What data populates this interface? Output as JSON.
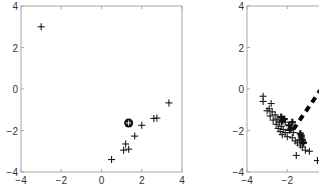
{
  "chart_data": [
    {
      "type": "scatter",
      "title": "",
      "xlabel": "",
      "ylabel": "",
      "xlim": [
        -4,
        4
      ],
      "ylim": [
        -4,
        4
      ],
      "xticks": [
        -4,
        -2,
        0,
        2,
        4
      ],
      "yticks": [
        -4,
        -2,
        0,
        2,
        4
      ],
      "xtick_labels": [
        "−4",
        "−2",
        "0",
        "2",
        "4"
      ],
      "ytick_labels": [
        "−4",
        "−2",
        "0",
        "2",
        "4"
      ],
      "grid": false,
      "frame": {
        "left": 21,
        "top": 6,
        "right": 182,
        "bottom": 172
      },
      "series": [
        {
          "name": "points",
          "marker": "plus",
          "points": [
            [
              -3.0,
              3.0
            ],
            [
              3.35,
              -0.67
            ],
            [
              2.6,
              -1.42
            ],
            [
              2.75,
              -1.4
            ],
            [
              2.0,
              -1.75
            ],
            [
              1.65,
              -2.27
            ],
            [
              1.2,
              -2.65
            ],
            [
              1.1,
              -2.95
            ],
            [
              1.35,
              -2.9
            ],
            [
              0.5,
              -3.4
            ]
          ]
        },
        {
          "name": "center",
          "marker": "circle-plus",
          "points": [
            [
              1.35,
              -1.64
            ]
          ]
        }
      ]
    },
    {
      "type": "scatter",
      "title": "",
      "xlabel": "",
      "ylabel": "",
      "xlim": [
        -4,
        4
      ],
      "ylim": [
        -4,
        4
      ],
      "xticks": [
        -4,
        -2
      ],
      "yticks": [
        -4,
        -2,
        0,
        2,
        4
      ],
      "xtick_labels": [
        "−4",
        "−2"
      ],
      "ytick_labels": [
        "−4",
        "−2",
        "0",
        "2",
        "4"
      ],
      "grid": false,
      "frame": {
        "left": 247,
        "top": 6,
        "right": 408,
        "bottom": 172
      },
      "series": [
        {
          "name": "points",
          "marker": "plus",
          "points": [
            [
              -3.2,
              -0.35
            ],
            [
              -3.2,
              -0.6
            ],
            [
              -2.8,
              -0.7
            ],
            [
              -2.9,
              -0.95
            ],
            [
              -3.0,
              -1.05
            ],
            [
              -2.75,
              -1.1
            ],
            [
              -2.85,
              -1.3
            ],
            [
              -2.6,
              -1.25
            ],
            [
              -2.7,
              -1.5
            ],
            [
              -2.5,
              -1.45
            ],
            [
              -2.55,
              -1.7
            ],
            [
              -2.4,
              -1.6
            ],
            [
              -2.45,
              -1.9
            ],
            [
              -2.3,
              -1.8
            ],
            [
              -2.35,
              -2.05
            ],
            [
              -2.2,
              -1.95
            ],
            [
              -2.1,
              -2.1
            ],
            [
              -2.0,
              -2.3
            ],
            [
              -2.25,
              -2.2
            ],
            [
              -1.9,
              -2.0
            ],
            [
              -1.8,
              -1.85
            ],
            [
              -1.7,
              -2.1
            ],
            [
              -1.75,
              -2.35
            ],
            [
              -1.6,
              -2.5
            ],
            [
              -1.5,
              -2.6
            ],
            [
              -1.4,
              -2.45
            ],
            [
              -1.35,
              -2.7
            ],
            [
              -1.25,
              -2.8
            ],
            [
              -1.2,
              -2.55
            ],
            [
              -1.1,
              -2.95
            ],
            [
              -0.9,
              -3.0
            ],
            [
              -1.55,
              -3.2
            ],
            [
              -0.5,
              -3.45
            ],
            [
              -2.1,
              -1.6
            ],
            [
              -1.3,
              -2.35
            ]
          ]
        },
        {
          "name": "bold-points",
          "marker": "plus-bold",
          "points": [
            [
              -2.3,
              -1.35
            ],
            [
              -2.25,
              -1.55
            ],
            [
              -2.15,
              -1.45
            ],
            [
              -1.9,
              -1.75
            ],
            [
              -1.85,
              -1.95
            ],
            [
              -1.75,
              -1.6
            ],
            [
              -1.3,
              -2.25
            ],
            [
              -1.25,
              -2.45
            ],
            [
              -1.2,
              -2.6
            ],
            [
              -1.35,
              -2.15
            ]
          ]
        },
        {
          "name": "direction",
          "marker": "dashed-line",
          "points": [
            [
              -1.7,
              -1.95
            ],
            [
              0.4,
              1.0
            ]
          ]
        }
      ]
    }
  ]
}
